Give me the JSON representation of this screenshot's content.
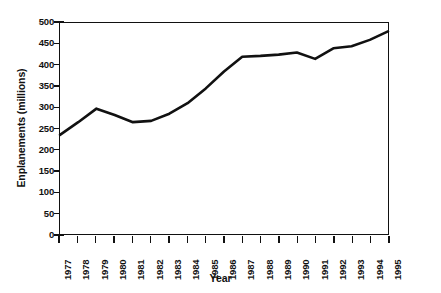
{
  "chart_data": {
    "type": "line",
    "title": "",
    "xlabel": "Year",
    "ylabel": "Enplanements (millions)",
    "categories": [
      "1977",
      "1978",
      "1979",
      "1980",
      "1981",
      "1982",
      "1983",
      "1984",
      "1985",
      "1986",
      "1987",
      "1988",
      "1989",
      "1990",
      "1991",
      "1992",
      "1993",
      "1994",
      "1995"
    ],
    "x": [
      1977,
      1978,
      1979,
      1980,
      1981,
      1982,
      1983,
      1984,
      1985,
      1986,
      1987,
      1988,
      1989,
      1990,
      1991,
      1992,
      1993,
      1994,
      1995
    ],
    "values": [
      235,
      265,
      297,
      282,
      265,
      268,
      285,
      310,
      345,
      385,
      420,
      422,
      425,
      430,
      415,
      440,
      445,
      460,
      480
    ],
    "series": [
      {
        "name": "Enplanements",
        "values": [
          235,
          265,
          297,
          282,
          265,
          268,
          285,
          310,
          345,
          385,
          420,
          422,
          425,
          430,
          415,
          440,
          445,
          460,
          480
        ]
      }
    ],
    "ylim": [
      0,
      500
    ],
    "yticks": [
      0,
      50,
      100,
      150,
      200,
      250,
      300,
      350,
      400,
      450,
      500
    ],
    "ytick_labels": [
      "0",
      "50",
      "100",
      "150",
      "200",
      "250",
      "300",
      "350",
      "400",
      "450",
      "500"
    ],
    "xlim": [
      1977,
      1995
    ],
    "grid": false,
    "legend": false,
    "legend_position": "none",
    "line_color": "#111111",
    "background_color": "#ffffff"
  }
}
